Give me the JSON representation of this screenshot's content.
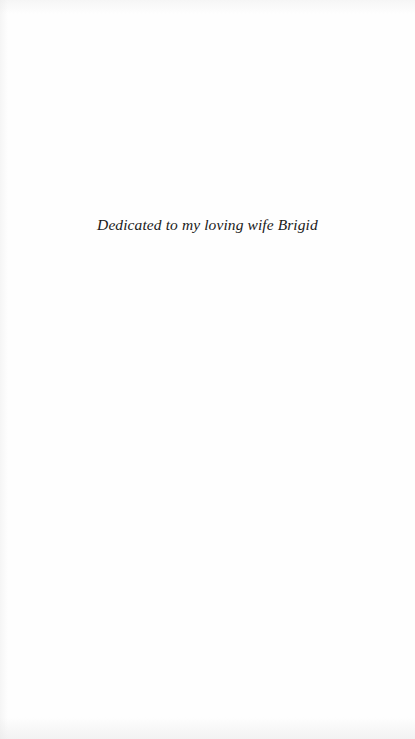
{
  "page": {
    "type": "dedication",
    "background_color": "#fefefe",
    "text_color": "#1a1a1a"
  },
  "dedication": {
    "text": "Dedicated to my loving wife Brigid"
  }
}
